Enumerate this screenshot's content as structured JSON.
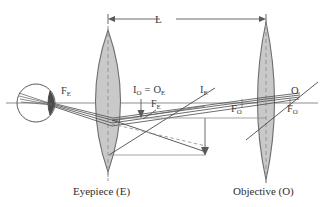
{
  "figure": {
    "type": "optics-ray-diagram",
    "background_color": "#ffffff",
    "lens_fill_color": "#c9c9c9",
    "lens_stroke_color": "#6e6e6e",
    "ray_color": "#4a4a4a",
    "axis_color": "#888888",
    "dashed_axis_color": "#9a9a9a",
    "label_color": "#3a3a3a"
  },
  "dimension": {
    "label": "L",
    "label_full": "separation between eyepiece and objective",
    "from_x": 108,
    "to_x": 266,
    "y": 19
  },
  "labels": {
    "eyepiece_focus_left": {
      "text": "F",
      "sub": "E"
    },
    "eyepiece_focus_inner": {
      "text": "F",
      "sub": "E"
    },
    "intermediate_image": {
      "text": "I",
      "sub": "O",
      "equals": "=",
      "text2": "O",
      "sub2": "E"
    },
    "final_image": {
      "text": "I",
      "sub": "E"
    },
    "objective_focus_left": {
      "text": "F",
      "sub": "O"
    },
    "objective_focus_right": {
      "text": "F",
      "sub": "O"
    },
    "object_point": {
      "text": "O"
    }
  },
  "components": {
    "eyepiece_caption": "Eyepiece (E)",
    "objective_caption": "Objective (O)",
    "eye": "observer-eye"
  },
  "geometry": {
    "optical_axis_y": 103,
    "eyepiece_center_x": 108,
    "objective_center_x": 266,
    "eye_center_x": 36,
    "eye_center_y": 103,
    "eye_radius": 19
  }
}
